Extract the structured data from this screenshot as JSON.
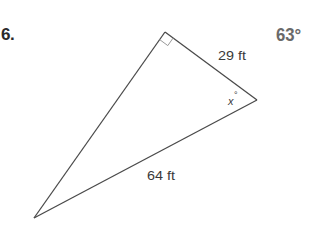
{
  "problem": {
    "number": "6.",
    "answer": "63°"
  },
  "figure": {
    "type": "right-triangle",
    "vertices": {
      "right_angle": {
        "x": 165,
        "y": 32
      },
      "acute_right": {
        "x": 257,
        "y": 100
      },
      "acute_bottom_left": {
        "x": 34,
        "y": 218
      }
    },
    "labels": {
      "leg": "29 ft",
      "hypotenuse": "64 ft",
      "angle_var": "x",
      "angle_degree": "°"
    },
    "colors": {
      "stroke": "#4a4a4a",
      "right_angle_marker": "#9a9a9a",
      "text": "#3a3a3a",
      "answer": "#6a6a6a"
    }
  }
}
